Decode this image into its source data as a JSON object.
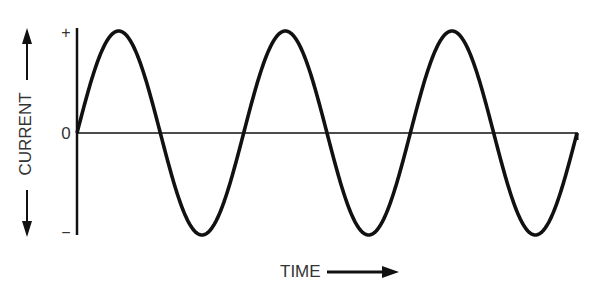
{
  "chart_data": {
    "type": "line",
    "title": "",
    "xlabel": "TIME",
    "ylabel": "CURRENT",
    "y_tick_labels": [
      "+",
      "0",
      "−"
    ],
    "waveform": "sine",
    "cycles": 3,
    "x": [
      0,
      0.25,
      0.5,
      0.75,
      1.0,
      1.25,
      1.5,
      1.75,
      2.0,
      2.25,
      2.5,
      2.75,
      3.0
    ],
    "values": [
      0,
      1,
      0,
      -1,
      0,
      1,
      0,
      -1,
      0,
      1,
      0,
      -1,
      0
    ],
    "ylim": [
      -1,
      1
    ],
    "grid": false,
    "legend": null,
    "annotations": [
      "arrow along y-axis label (both directions)",
      "arrow pointing right after TIME label"
    ]
  },
  "labels": {
    "y_axis": "CURRENT",
    "x_axis": "TIME",
    "plus": "+",
    "zero": "0",
    "minus": "−"
  },
  "colors": {
    "stroke": "#111111",
    "text": "#333333",
    "background": "#ffffff"
  }
}
